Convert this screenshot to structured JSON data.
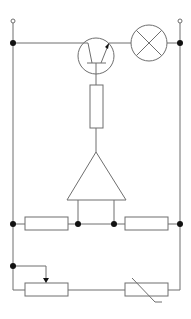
{
  "diagram": {
    "type": "circuit-schematic",
    "title": "",
    "colors": {
      "wire": "#6e6e6e",
      "junction": "#111111",
      "background": "#ffffff"
    },
    "components": [
      {
        "id": "terminal-left",
        "kind": "terminal",
        "label": ""
      },
      {
        "id": "terminal-right",
        "kind": "terminal",
        "label": ""
      },
      {
        "id": "transistor",
        "kind": "npn-transistor",
        "label": ""
      },
      {
        "id": "lamp",
        "kind": "lamp",
        "label": ""
      },
      {
        "id": "base-resistor",
        "kind": "resistor",
        "label": ""
      },
      {
        "id": "op-amp",
        "kind": "amplifier-triangle",
        "label": ""
      },
      {
        "id": "resistor-left",
        "kind": "resistor",
        "label": ""
      },
      {
        "id": "resistor-right",
        "kind": "resistor",
        "label": ""
      },
      {
        "id": "potentiometer",
        "kind": "variable-resistor",
        "label": ""
      },
      {
        "id": "thermistor",
        "kind": "thermistor",
        "label": ""
      }
    ],
    "junction_count": 7
  }
}
